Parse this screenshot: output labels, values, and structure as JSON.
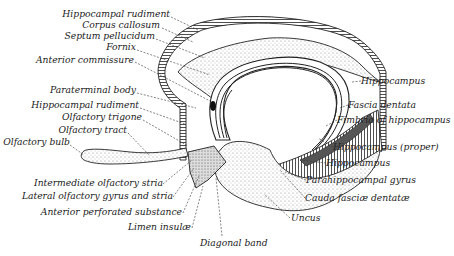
{
  "diagram": {
    "labels_left": [
      {
        "text": "Hippocampal rudiment",
        "x": 170,
        "y": 17
      },
      {
        "text": "Corpus callosum",
        "x": 174,
        "y": 28
      },
      {
        "text": "Septum pellucidum",
        "x": 156,
        "y": 39
      },
      {
        "text": "Fornix",
        "x": 136,
        "y": 50
      },
      {
        "text": "Anterior commissure",
        "x": 134,
        "y": 63
      },
      {
        "text": "Paraterminal body",
        "x": 136,
        "y": 93
      },
      {
        "text": "Hippocampal rudiment",
        "x": 139,
        "y": 108
      },
      {
        "text": "Olfactory trigone",
        "x": 142,
        "y": 120
      },
      {
        "text": "Olfactory tract",
        "x": 127,
        "y": 133
      },
      {
        "text": "Olfactory bulb",
        "x": 70,
        "y": 145
      }
    ],
    "labels_bottom": [
      {
        "text": "Intermediate olfactory stria",
        "x": 163,
        "y": 186
      },
      {
        "text": "Lateral olfactory gyrus and stria",
        "x": 173,
        "y": 199
      },
      {
        "text": "Anterior perforated substance",
        "x": 182,
        "y": 215
      },
      {
        "text": "Limen insulæ",
        "x": 191,
        "y": 230
      },
      {
        "text": "Diagonal band",
        "x": 222,
        "y": 245
      }
    ],
    "labels_right": [
      {
        "text": "Hippocampus",
        "x": 361,
        "y": 84
      },
      {
        "text": "Fascia dentata",
        "x": 348,
        "y": 108
      },
      {
        "text": "Fimbria of hippocampus",
        "x": 337,
        "y": 123
      },
      {
        "text": "Hippocampus (proper)",
        "x": 333,
        "y": 150
      },
      {
        "text": "Hippocampus",
        "x": 326,
        "y": 166
      },
      {
        "text": "Parahippocampal gyrus",
        "x": 306,
        "y": 183
      },
      {
        "text": "Cauda fasciæ dentatæ",
        "x": 305,
        "y": 201
      },
      {
        "text": "Uncus",
        "x": 291,
        "y": 221
      }
    ]
  }
}
